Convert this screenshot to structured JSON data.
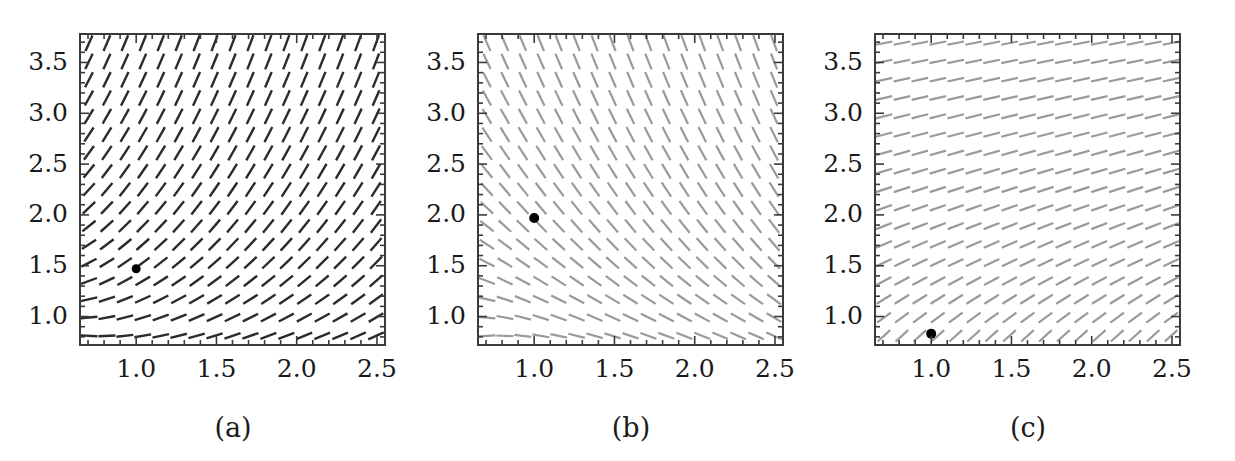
{
  "figure": {
    "width": 1235,
    "height": 461,
    "background": "#ffffff",
    "kind": "slope-field-triptych"
  },
  "chart_data": [
    {
      "type": "scatter",
      "panel": "a",
      "caption": "(a)",
      "title": "",
      "xlabel": "",
      "ylabel": "",
      "xlim": [
        0.65,
        2.55
      ],
      "ylim": [
        0.72,
        3.78
      ],
      "xticks": [
        1.0,
        1.5,
        2.0,
        2.5
      ],
      "xtick_labels": [
        "1.0",
        "1.5",
        "2.0",
        "2.5"
      ],
      "yticks": [
        1.0,
        1.5,
        2.0,
        2.5,
        3.0,
        3.5
      ],
      "ytick_labels": [
        "1.0",
        "1.5",
        "2.0",
        "2.5",
        "3.0",
        "3.5"
      ],
      "minor_ticks_per_interval": 5,
      "grid": false,
      "legend": "none",
      "field": {
        "description": "direction field of positive slopes, shallow at lower-left, steep up-right",
        "color": "#2b2b2b",
        "line_width": 2.4,
        "segment_length": 17,
        "nx": 17,
        "ny": 17,
        "slope_formula": "m = 1.25*(y - 0.62/x)",
        "slope_min": -0.1,
        "slope_max": 4.2
      },
      "marker": {
        "x": 1.0,
        "y": 1.47,
        "color": "#000000",
        "radius": 4.5,
        "shape": "filled-circle"
      }
    },
    {
      "type": "scatter",
      "panel": "b",
      "caption": "(b)",
      "title": "",
      "xlabel": "",
      "ylabel": "",
      "xlim": [
        0.65,
        2.55
      ],
      "ylim": [
        0.72,
        3.78
      ],
      "xticks": [
        1.0,
        1.5,
        2.0,
        2.5
      ],
      "xtick_labels": [
        "1.0",
        "1.5",
        "2.0",
        "2.5"
      ],
      "yticks": [
        1.0,
        1.5,
        2.0,
        2.5,
        3.0,
        3.5
      ],
      "ytick_labels": [
        "1.0",
        "1.5",
        "2.0",
        "2.5",
        "3.0",
        "3.5"
      ],
      "minor_ticks_per_interval": 5,
      "grid": false,
      "legend": "none",
      "field": {
        "description": "direction field of negative slopes, nearly vertical at top, shallow at lower-left",
        "color": "#9a9a9a",
        "line_width": 2.2,
        "segment_length": 17,
        "nx": 17,
        "ny": 17,
        "slope_formula": "m = -1.25*(y - 0.62/x)",
        "slope_min": -4.2,
        "slope_max": 0.1
      },
      "marker": {
        "x": 1.0,
        "y": 1.97,
        "color": "#000000",
        "radius": 5.0,
        "shape": "filled-circle"
      }
    },
    {
      "type": "scatter",
      "panel": "c",
      "caption": "(c)",
      "title": "",
      "xlabel": "",
      "ylabel": "",
      "xlim": [
        0.65,
        2.55
      ],
      "ylim": [
        0.72,
        3.78
      ],
      "xticks": [
        1.0,
        1.5,
        2.0,
        2.5
      ],
      "xtick_labels": [
        "1.0",
        "1.5",
        "2.0",
        "2.5"
      ],
      "yticks": [
        1.0,
        1.5,
        2.0,
        2.5,
        3.0,
        3.5
      ],
      "ytick_labels": [
        "1.0",
        "1.5",
        "2.0",
        "2.5",
        "3.0",
        "3.5"
      ],
      "minor_ticks_per_interval": 5,
      "grid": false,
      "legend": "none",
      "field": {
        "description": "direction field of mild positive slopes, steeper at bottom, flattening toward top",
        "color": "#9a9a9a",
        "line_width": 2.2,
        "segment_length": 17,
        "nx": 17,
        "ny": 17,
        "slope_formula": "m = 1.15/y",
        "slope_min": 0.3,
        "slope_max": 1.55
      },
      "marker": {
        "x": 1.0,
        "y": 0.83,
        "color": "#000000",
        "radius": 5.0,
        "shape": "filled-circle"
      }
    }
  ],
  "panels": [
    {
      "id": "a",
      "caption": "(a)",
      "caption_x": 233,
      "caption_y": 412,
      "frame": {
        "left": 80,
        "top": 34,
        "right": 385,
        "bottom": 345,
        "color": "#3a3a3a",
        "width": 2
      }
    },
    {
      "id": "b",
      "caption": "(b)",
      "caption_x": 631,
      "caption_y": 412,
      "frame": {
        "left": 478,
        "top": 34,
        "right": 783,
        "bottom": 345,
        "color": "#3a3a3a",
        "width": 2
      }
    },
    {
      "id": "c",
      "caption": "(c)",
      "caption_x": 1028,
      "caption_y": 412,
      "frame": {
        "left": 875,
        "top": 34,
        "right": 1180,
        "bottom": 345,
        "color": "#3a3a3a",
        "width": 2
      }
    }
  ]
}
